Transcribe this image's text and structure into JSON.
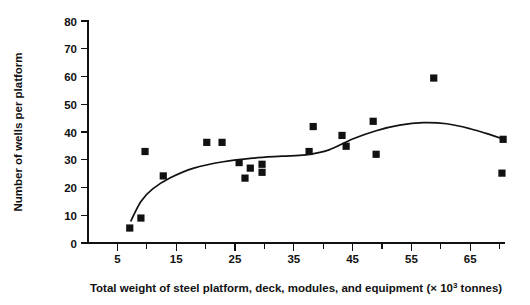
{
  "chart_data": {
    "type": "scatter",
    "title": "",
    "xlabel": "Total weight of steel platform, deck, modules, and equipment (× 10³ tonnes)",
    "xlabel_main": "Total weight of steel platform, deck, modules, and equipment (× 10",
    "xlabel_exponent": "3",
    "xlabel_tail": " tonnes)",
    "ylabel": "Number of wells per platform",
    "xlim": [
      0,
      72
    ],
    "ylim": [
      0,
      80
    ],
    "xticks": [
      5,
      15,
      25,
      35,
      45,
      55,
      65
    ],
    "xticks_minor": [
      10,
      20,
      30,
      40,
      50,
      60,
      70
    ],
    "yticks": [
      0,
      10,
      20,
      30,
      40,
      50,
      60,
      70,
      80
    ],
    "grid": false,
    "legend": null,
    "marker": "filled-square",
    "marker_color": "#111111",
    "points": [
      {
        "x": 7.1,
        "y": 5.4
      },
      {
        "x": 9.0,
        "y": 9.0
      },
      {
        "x": 9.7,
        "y": 33.0
      },
      {
        "x": 12.8,
        "y": 24.2
      },
      {
        "x": 20.2,
        "y": 36.3
      },
      {
        "x": 22.8,
        "y": 36.3
      },
      {
        "x": 25.7,
        "y": 29.0
      },
      {
        "x": 26.7,
        "y": 23.4
      },
      {
        "x": 27.6,
        "y": 27.0
      },
      {
        "x": 29.6,
        "y": 28.4
      },
      {
        "x": 29.6,
        "y": 25.5
      },
      {
        "x": 37.6,
        "y": 33.0
      },
      {
        "x": 38.3,
        "y": 42.0
      },
      {
        "x": 43.2,
        "y": 38.8
      },
      {
        "x": 43.9,
        "y": 34.9
      },
      {
        "x": 48.5,
        "y": 43.9
      },
      {
        "x": 49.0,
        "y": 32.0
      },
      {
        "x": 58.8,
        "y": 59.5
      },
      {
        "x": 70.6,
        "y": 37.4
      },
      {
        "x": 70.4,
        "y": 25.2
      }
    ],
    "trend_line": {
      "style": "smooth-fit-curve",
      "points": [
        {
          "x": 7.3,
          "y": 8.0
        },
        {
          "x": 9.0,
          "y": 15.0
        },
        {
          "x": 11.0,
          "y": 19.5
        },
        {
          "x": 14.0,
          "y": 23.5
        },
        {
          "x": 18.0,
          "y": 27.0
        },
        {
          "x": 23.0,
          "y": 29.3
        },
        {
          "x": 28.0,
          "y": 30.6
        },
        {
          "x": 33.0,
          "y": 31.3
        },
        {
          "x": 37.0,
          "y": 31.8
        },
        {
          "x": 41.0,
          "y": 33.6
        },
        {
          "x": 45.0,
          "y": 37.5
        },
        {
          "x": 49.0,
          "y": 40.5
        },
        {
          "x": 53.0,
          "y": 42.5
        },
        {
          "x": 57.0,
          "y": 43.4
        },
        {
          "x": 61.0,
          "y": 43.0
        },
        {
          "x": 65.0,
          "y": 41.2
        },
        {
          "x": 68.5,
          "y": 39.0
        },
        {
          "x": 70.6,
          "y": 37.5
        }
      ]
    }
  }
}
